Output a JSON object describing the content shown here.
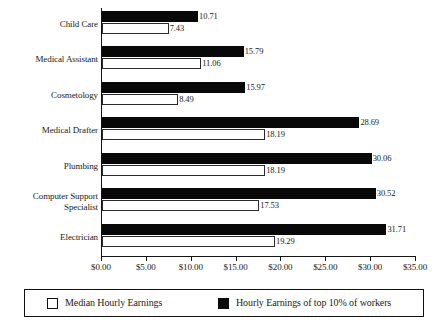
{
  "chart_data": {
    "type": "bar",
    "orientation": "horizontal",
    "title": "",
    "xlabel": "",
    "ylabel": "",
    "xlim": [
      0,
      35
    ],
    "xtick_values": [
      0,
      5,
      10,
      15,
      20,
      25,
      30,
      35
    ],
    "xtick_labels": [
      "$0.00",
      "$5.00",
      "$10.00",
      "$15.00",
      "$20.00",
      "$25.00",
      "$30.00",
      "$35.00"
    ],
    "grid": false,
    "legend_position": "bottom",
    "categories": [
      "Child Care",
      "Medical Assistant",
      "Cosmetology",
      "Medical Drafter",
      "Plumbing",
      "Computer Support\nSpecialist",
      "Electrician"
    ],
    "series": [
      {
        "name": "Hourly Earnings of top 10% of workers",
        "color": "#080808",
        "values": [
          10.71,
          15.79,
          15.97,
          28.69,
          30.06,
          30.52,
          31.71
        ],
        "labels": [
          "10.71",
          "15.79",
          "15.97",
          "28.69",
          "30.06",
          "30.52",
          "31.71"
        ]
      },
      {
        "name": "Median Hourly Earnings",
        "color": "#ffffff",
        "values": [
          7.43,
          11.06,
          8.49,
          18.19,
          18.19,
          17.53,
          19.29
        ],
        "labels": [
          "7.43",
          "11.06",
          "8.49",
          "18.19",
          "18.19",
          "17.53",
          "19.29"
        ]
      }
    ]
  },
  "legend": {
    "items": [
      {
        "label": "Median Hourly Earnings",
        "swatch": "median-swatch"
      },
      {
        "label": "Hourly Earnings of top 10% of workers",
        "swatch": "top10-swatch"
      }
    ]
  }
}
